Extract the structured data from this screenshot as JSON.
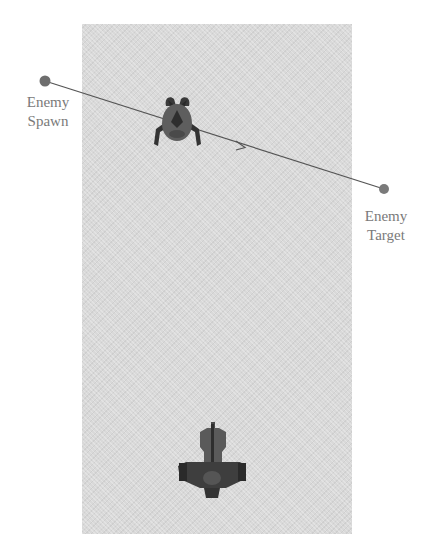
{
  "diagram": {
    "labels": {
      "spawn_line1": "Enemy",
      "spawn_line2": "Spawn",
      "target_line1": "Enemy",
      "target_line2": "Target"
    },
    "points": {
      "spawn": {
        "x": 45,
        "y": 81
      },
      "target": {
        "x": 384,
        "y": 189
      }
    },
    "entities": [
      {
        "name": "enemy-ship",
        "center": {
          "x": 177,
          "y": 120
        }
      },
      {
        "name": "player-ship",
        "center": {
          "x": 212,
          "y": 462
        }
      }
    ],
    "colors": {
      "background": "#ffffff",
      "playfield": "#d9d9d9",
      "marker": "#6e6e6e",
      "path_line": "#555555",
      "label_text": "#7a7a7a",
      "ship_dark": "#3a3a3a",
      "ship_mid": "#5e5e5e"
    }
  }
}
